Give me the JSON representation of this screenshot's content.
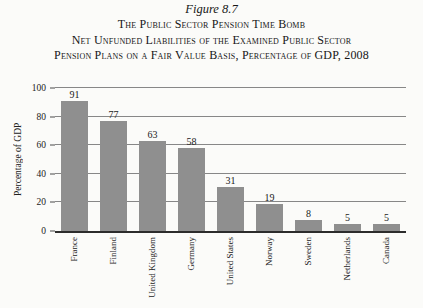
{
  "figure": {
    "label": "Figure 8.7",
    "title_lines": [
      "The Public Sector Pension Time Bomb",
      "Net Unfunded Liabilities of the Examined Public Sector",
      "Pension Plans on a Fair Value Basis, Percentage of GDP, 2008"
    ]
  },
  "chart_data": {
    "type": "bar",
    "categories": [
      "France",
      "Finland",
      "United Kingdom",
      "Germany",
      "United States",
      "Norway",
      "Sweden",
      "Netherlands",
      "Canada"
    ],
    "values": [
      91,
      77,
      63,
      58,
      31,
      19,
      8,
      5,
      5
    ],
    "title": "Net Unfunded Liabilities of the Examined Public Sector Pension Plans on a Fair Value Basis, Percentage of GDP, 2008",
    "xlabel": "",
    "ylabel": "Percentage of GDP",
    "ylim": [
      0,
      100
    ],
    "yticks": [
      0,
      20,
      40,
      60,
      80,
      100
    ],
    "grid": true,
    "legend": "none",
    "data_labels": true,
    "bar_color": "#8f8f8f",
    "gridline_color": "#878787"
  }
}
